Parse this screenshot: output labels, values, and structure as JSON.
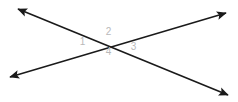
{
  "figure": {
    "kind": "geometry-diagram",
    "background_color": "#ffffff",
    "line_color": "#1a1a1a",
    "label_color": "#b9b9b9",
    "stroke_width": 1.6,
    "width": 238,
    "height": 102,
    "intersection": {
      "x": 108,
      "y": 44
    },
    "lines": [
      {
        "name": "line-descending",
        "direction": "top-left to bottom-right",
        "start": {
          "x": 18,
          "y": 9
        },
        "end": {
          "x": 228,
          "y": 95
        },
        "arrowheads": [
          "start",
          "end"
        ]
      },
      {
        "name": "line-ascending",
        "direction": "bottom-left to top-right",
        "start": {
          "x": 10,
          "y": 77
        },
        "end": {
          "x": 226,
          "y": 13
        },
        "arrowheads": [
          "start",
          "end"
        ]
      }
    ],
    "angle_labels": [
      {
        "id": "angle-1",
        "text": "1",
        "position": "left",
        "x": 82,
        "y": 42
      },
      {
        "id": "angle-2",
        "text": "2",
        "position": "top",
        "x": 108,
        "y": 32
      },
      {
        "id": "angle-3",
        "text": "3",
        "position": "right",
        "x": 133,
        "y": 47
      },
      {
        "id": "angle-4",
        "text": "4",
        "position": "bottom",
        "x": 108,
        "y": 52
      }
    ]
  }
}
